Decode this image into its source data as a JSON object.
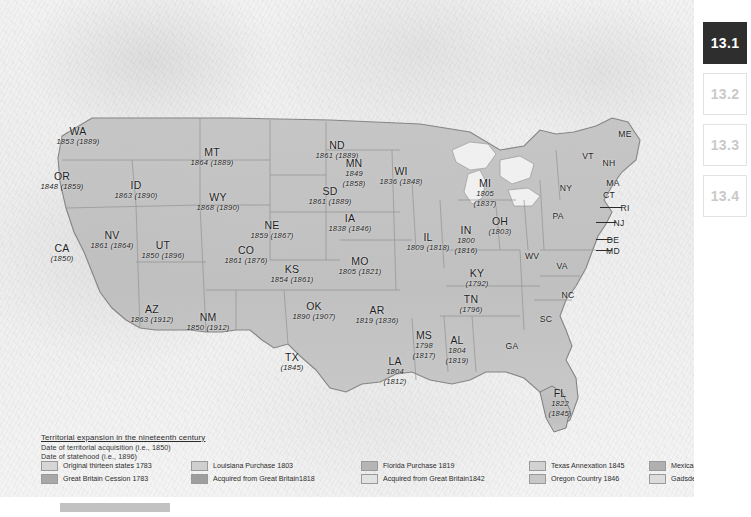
{
  "map": {
    "title": "Territorial expansion in the nineteenth century",
    "note_acquisition": "Date of territorial acquisition (i.e., 1850)",
    "note_statehood": "Date of statehood (i.e., 1896)"
  },
  "legend": {
    "items": [
      {
        "label": "Original thirteen states 1783",
        "color": "#d6d6d6"
      },
      {
        "label": "Great Britain Cession  1783",
        "color": "#a8a8a8"
      },
      {
        "label": "Louisiana Purchase 1803",
        "color": "#cfcfcf"
      },
      {
        "label": "Acquired from Great Britain1818",
        "color": "#9e9e9e"
      },
      {
        "label": "Florida Purchase 1819",
        "color": "#b5b5b5"
      },
      {
        "label": "Acquired from Great Britain1842",
        "color": "#e2e2e2"
      },
      {
        "label": "Texas Annexation 1845",
        "color": "#d2d2d2"
      },
      {
        "label": "Oregon Country 1846",
        "color": "#c8c8c8"
      },
      {
        "label": "Mexican Cession 1848",
        "color": "#b0b0b0"
      },
      {
        "label": "Gadsden Purchase 1853",
        "color": "#dcdcdc"
      }
    ]
  },
  "states": [
    {
      "ab": "WA",
      "dt": "1853 (1889)",
      "x": 78,
      "y": 126,
      "w": 64
    },
    {
      "ab": "OR",
      "dt": "1848 (1859)",
      "x": 62,
      "y": 171,
      "w": 64
    },
    {
      "ab": "ID",
      "dt": "1863 (1890)",
      "x": 136,
      "y": 180,
      "w": 64
    },
    {
      "ab": "MT",
      "dt": "1864 (1889)",
      "x": 212,
      "y": 147,
      "w": 64
    },
    {
      "ab": "WY",
      "dt": "1868 (1890)",
      "x": 218,
      "y": 192,
      "w": 64
    },
    {
      "ab": "NV",
      "dt": "1861 (1864)",
      "x": 112,
      "y": 230,
      "w": 64
    },
    {
      "ab": "UT",
      "dt": "1850 (1896)",
      "x": 163,
      "y": 240,
      "w": 64
    },
    {
      "ab": "CA",
      "dt": "(1850)",
      "x": 62,
      "y": 243,
      "w": 54
    },
    {
      "ab": "AZ",
      "dt": "1863 (1912)",
      "x": 152,
      "y": 304,
      "w": 58
    },
    {
      "ab": "NM",
      "dt": "1850 (1912)",
      "x": 208,
      "y": 312,
      "w": 58
    },
    {
      "ab": "CO",
      "dt": "1861 (1876)",
      "x": 246,
      "y": 245,
      "w": 64
    },
    {
      "ab": "ND",
      "dt": "1861 (1889)",
      "x": 337,
      "y": 140,
      "w": 64
    },
    {
      "ab": "SD",
      "dt": "1861 (1889)",
      "x": 330,
      "y": 186,
      "w": 64
    },
    {
      "ab": "NE",
      "dt": "1859 (1867)",
      "x": 272,
      "y": 220,
      "w": 64
    },
    {
      "ab": "KS",
      "dt": "1854 (1861)",
      "x": 292,
      "y": 264,
      "w": 64
    },
    {
      "ab": "OK",
      "dt": "1890 (1907)",
      "x": 314,
      "y": 301,
      "w": 64
    },
    {
      "ab": "TX",
      "dt": "(1845)",
      "x": 292,
      "y": 352,
      "w": 54
    },
    {
      "ab": "MN",
      "dt": "1849\n(1858)",
      "x": 354,
      "y": 158,
      "w": 48
    },
    {
      "ab": "WI",
      "dt": "1836 (1848)",
      "x": 401,
      "y": 166,
      "w": 64
    },
    {
      "ab": "IA",
      "dt": "1838 (1846)",
      "x": 350,
      "y": 213,
      "w": 64
    },
    {
      "ab": "MO",
      "dt": "1805 (1821)",
      "x": 360,
      "y": 256,
      "w": 64
    },
    {
      "ab": "AR",
      "dt": "1819 (1836)",
      "x": 377,
      "y": 305,
      "w": 64
    },
    {
      "ab": "LA",
      "dt": "1804\n(1812)",
      "x": 395,
      "y": 356,
      "w": 44
    },
    {
      "ab": "MS",
      "dt": "1798\n(1817)",
      "x": 424,
      "y": 330,
      "w": 40
    },
    {
      "ab": "AL",
      "dt": "1804\n(1819)",
      "x": 457,
      "y": 335,
      "w": 40
    },
    {
      "ab": "IL",
      "dt": "1809 (1818)",
      "x": 428,
      "y": 232,
      "w": 64
    },
    {
      "ab": "IN",
      "dt": "1800\n(1816)",
      "x": 466,
      "y": 225,
      "w": 40
    },
    {
      "ab": "MI",
      "dt": "1805\n(1837)",
      "x": 485,
      "y": 178,
      "w": 40
    },
    {
      "ab": "OH",
      "dt": "(1803)",
      "x": 500,
      "y": 216,
      "w": 40
    },
    {
      "ab": "KY",
      "dt": "(1792)",
      "x": 477,
      "y": 268,
      "w": 40
    },
    {
      "ab": "TN",
      "dt": "(1796)",
      "x": 471,
      "y": 294,
      "w": 40
    },
    {
      "ab": "FL",
      "dt": "1822\n(1845)",
      "x": 560,
      "y": 388,
      "w": 40
    }
  ],
  "plain_states": [
    {
      "ab": "ME",
      "x": 625,
      "y": 129
    },
    {
      "ab": "VT",
      "x": 588,
      "y": 151
    },
    {
      "ab": "NH",
      "x": 609,
      "y": 158
    },
    {
      "ab": "MA",
      "x": 613,
      "y": 178
    },
    {
      "ab": "CT",
      "x": 609,
      "y": 190
    },
    {
      "ab": "RI",
      "x": 625,
      "y": 203
    },
    {
      "ab": "NY",
      "x": 566,
      "y": 183
    },
    {
      "ab": "PA",
      "x": 558,
      "y": 211
    },
    {
      "ab": "NJ",
      "x": 619,
      "y": 218
    },
    {
      "ab": "DE",
      "x": 613,
      "y": 235
    },
    {
      "ab": "MD",
      "x": 613,
      "y": 246
    },
    {
      "ab": "WV",
      "x": 532,
      "y": 251
    },
    {
      "ab": "VA",
      "x": 562,
      "y": 261
    },
    {
      "ab": "NC",
      "x": 568,
      "y": 290
    },
    {
      "ab": "SC",
      "x": 546,
      "y": 314
    },
    {
      "ab": "GA",
      "x": 512,
      "y": 341
    }
  ],
  "tabs": [
    {
      "label": "13.1",
      "active": true
    },
    {
      "label": "13.2",
      "active": false
    },
    {
      "label": "13.3",
      "active": false
    },
    {
      "label": "13.4",
      "active": false
    }
  ]
}
